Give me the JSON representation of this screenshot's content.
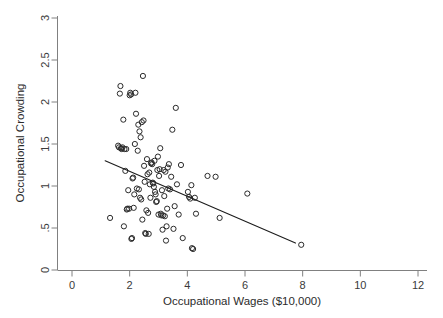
{
  "chart_data": {
    "type": "scatter",
    "title": "",
    "xlabel": "Occupational Wages ($10,000)",
    "ylabel": "Occupational Crowding",
    "xlim": [
      0,
      12
    ],
    "ylim": [
      0,
      3
    ],
    "grid": false,
    "legend": null,
    "xticks": [
      "0",
      "2",
      "4",
      "6",
      "8",
      "10",
      "12"
    ],
    "xtick_values": [
      0,
      2,
      4,
      6,
      8,
      10,
      12
    ],
    "yticks": [
      "0",
      ".5",
      "1",
      "1.5",
      "2",
      "2.5",
      "3"
    ],
    "ytick_values": [
      0,
      0.5,
      1,
      1.5,
      2,
      2.5,
      3
    ],
    "marker": "open-circle",
    "marker_color": "#2a2a2a",
    "series": [
      {
        "name": "occupations",
        "points": [
          [
            1.32,
            0.62
          ],
          [
            1.6,
            1.48
          ],
          [
            1.63,
            1.46
          ],
          [
            1.66,
            2.1
          ],
          [
            1.68,
            2.19
          ],
          [
            1.7,
            1.45
          ],
          [
            1.72,
            1.44
          ],
          [
            1.75,
            1.46
          ],
          [
            1.78,
            1.79
          ],
          [
            1.8,
            0.52
          ],
          [
            1.82,
            1.44
          ],
          [
            1.85,
            1.18
          ],
          [
            1.88,
            1.44
          ],
          [
            1.9,
            0.72
          ],
          [
            1.92,
            0.73
          ],
          [
            1.95,
            0.95
          ],
          [
            1.98,
            0.73
          ],
          [
            2.0,
            2.08
          ],
          [
            2.02,
            2.11
          ],
          [
            2.05,
            2.09
          ],
          [
            2.06,
            0.37
          ],
          [
            2.08,
            0.38
          ],
          [
            2.1,
            1.09
          ],
          [
            2.12,
            1.1
          ],
          [
            2.14,
            0.74
          ],
          [
            2.16,
            0.9
          ],
          [
            2.18,
            1.5
          ],
          [
            2.2,
            2.11
          ],
          [
            2.22,
            1.86
          ],
          [
            2.25,
            0.97
          ],
          [
            2.28,
            1.42
          ],
          [
            2.3,
            1.73
          ],
          [
            2.32,
            0.96
          ],
          [
            2.34,
            1.65
          ],
          [
            2.36,
            0.86
          ],
          [
            2.38,
            1.58
          ],
          [
            2.4,
            0.84
          ],
          [
            2.42,
            1.76
          ],
          [
            2.44,
            0.6
          ],
          [
            2.46,
            2.31
          ],
          [
            2.48,
            1.78
          ],
          [
            2.5,
            1.24
          ],
          [
            2.52,
            1.05
          ],
          [
            2.54,
            0.44
          ],
          [
            2.56,
            0.43
          ],
          [
            2.58,
            0.71
          ],
          [
            2.6,
            1.32
          ],
          [
            2.62,
            1.14
          ],
          [
            2.64,
            0.68
          ],
          [
            2.66,
            0.43
          ],
          [
            2.68,
            1.16
          ],
          [
            2.7,
            1.02
          ],
          [
            2.72,
            0.86
          ],
          [
            2.74,
            1.27
          ],
          [
            2.76,
            1.28
          ],
          [
            2.78,
            1.26
          ],
          [
            2.8,
            1.04
          ],
          [
            2.82,
            1.03
          ],
          [
            2.84,
            0.99
          ],
          [
            2.86,
            1.3
          ],
          [
            2.88,
            0.93
          ],
          [
            2.9,
            0.9
          ],
          [
            2.92,
            0.81
          ],
          [
            2.94,
            0.82
          ],
          [
            2.96,
            1.19
          ],
          [
            2.98,
            1.35
          ],
          [
            3.0,
            0.66
          ],
          [
            3.02,
            1.12
          ],
          [
            3.04,
            1.2
          ],
          [
            3.06,
            1.45
          ],
          [
            3.08,
            0.67
          ],
          [
            3.1,
            0.65
          ],
          [
            3.12,
            0.95
          ],
          [
            3.14,
            0.48
          ],
          [
            3.16,
            0.65
          ],
          [
            3.18,
            1.19
          ],
          [
            3.2,
            0.88
          ],
          [
            3.22,
            0.64
          ],
          [
            3.24,
            1.17
          ],
          [
            3.26,
            0.35
          ],
          [
            3.28,
            0.52
          ],
          [
            3.3,
            0.73
          ],
          [
            3.32,
            1.22
          ],
          [
            3.34,
            0.97
          ],
          [
            3.36,
            1.26
          ],
          [
            3.4,
            0.96
          ],
          [
            3.44,
            1.11
          ],
          [
            3.48,
            1.67
          ],
          [
            3.52,
            0.49
          ],
          [
            3.56,
            0.76
          ],
          [
            3.6,
            1.93
          ],
          [
            3.64,
            1.02
          ],
          [
            3.7,
            0.66
          ],
          [
            3.78,
            1.25
          ],
          [
            3.84,
            0.38
          ],
          [
            4.02,
            0.93
          ],
          [
            4.06,
            0.87
          ],
          [
            4.1,
            0.85
          ],
          [
            4.14,
            1.01
          ],
          [
            4.16,
            0.26
          ],
          [
            4.2,
            0.25
          ],
          [
            4.26,
            0.86
          ],
          [
            4.3,
            0.67
          ],
          [
            4.7,
            1.12
          ],
          [
            4.98,
            1.11
          ],
          [
            5.12,
            0.62
          ],
          [
            6.08,
            0.91
          ],
          [
            7.95,
            0.3
          ]
        ]
      }
    ],
    "fit_line": {
      "name": "linear fit",
      "x_start": 1.15,
      "y_start": 1.3,
      "x_end": 7.75,
      "y_end": 0.32,
      "color": "#1c1c1c"
    }
  }
}
